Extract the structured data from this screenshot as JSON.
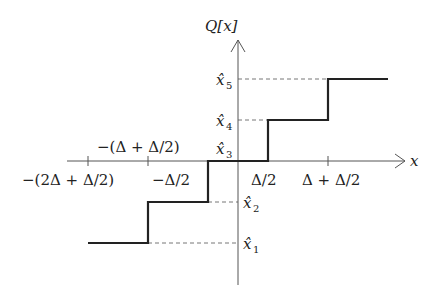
{
  "diagram": {
    "y_axis_label": "Q[x]",
    "x_axis_label": "x",
    "colors": {
      "axis": "#555555",
      "staircase": "#222222",
      "guide": "#777777",
      "text": "#222222"
    },
    "x_tick_labels": [
      {
        "id": "t1",
        "text": "−(2Δ + Δ/2)",
        "position": "below"
      },
      {
        "id": "t2",
        "text": "−(Δ + Δ/2)",
        "position": "above"
      },
      {
        "id": "t3",
        "text": "−Δ/2",
        "position": "below"
      },
      {
        "id": "t4",
        "text": "Δ/2",
        "position": "below"
      },
      {
        "id": "t5",
        "text": "Δ + Δ/2",
        "position": "below"
      }
    ],
    "levels": [
      {
        "id": "x1",
        "base": "x̂",
        "sub": "1"
      },
      {
        "id": "x2",
        "base": "x̂",
        "sub": "2"
      },
      {
        "id": "x3",
        "base": "x̂",
        "sub": "3"
      },
      {
        "id": "x4",
        "base": "x̂",
        "sub": "4"
      },
      {
        "id": "x5",
        "base": "x̂",
        "sub": "5"
      }
    ]
  }
}
